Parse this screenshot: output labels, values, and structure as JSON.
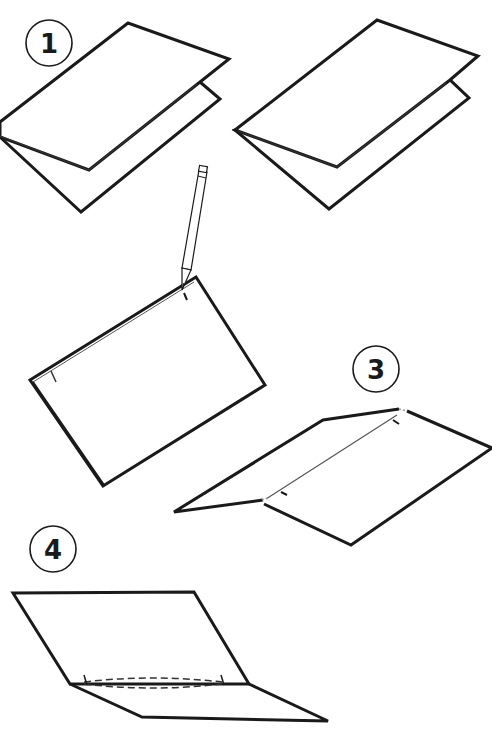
{
  "diagram": {
    "type": "instructional-folding-steps",
    "colors": {
      "background": "#ffffff",
      "line": "#1a1a1a"
    },
    "steps": [
      {
        "label": "1",
        "description": "Fold sheet of paper in half (two views of folded card)"
      },
      {
        "label": "",
        "description": "Mark fold line with pencil ticks near each end"
      },
      {
        "label": "3",
        "description": "Open card partially, showing marked fold line"
      },
      {
        "label": "4",
        "description": "Open card with dashed cut lines between tick marks"
      }
    ],
    "icons": [
      "pencil-icon"
    ]
  }
}
